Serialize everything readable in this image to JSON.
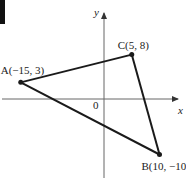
{
  "figure": {
    "axes": {
      "x_label": "x",
      "y_label": "y",
      "origin_label": "0"
    },
    "points": [
      {
        "name": "A",
        "x": -15,
        "y": 3,
        "label": "A(−15, 3)"
      },
      {
        "name": "B",
        "x": 10,
        "y": -10,
        "label": "B(10, −10)"
      },
      {
        "name": "C",
        "x": 5,
        "y": 8,
        "label": "C(5, 8)"
      }
    ],
    "triangle": [
      "A",
      "B",
      "C"
    ],
    "colors": {
      "line": "#1a1a1a",
      "axis": "#555555"
    }
  }
}
